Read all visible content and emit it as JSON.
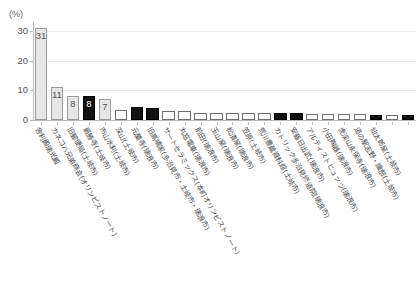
{
  "chart_data": {
    "type": "bar",
    "title": "",
    "xlabel": "",
    "ylabel": "(%)",
    "ylim": [
      0,
      33
    ],
    "yticks": [
      0,
      10,
      20,
      30
    ],
    "ytick_labels": [
      "0",
      "10",
      "20",
      "30"
    ],
    "grid": true,
    "legend": "none",
    "value_label_note": "Only the first five bars carry printed value labels; remaining bars are unlabeled and read off the axis.",
    "categories": [
      "舎利殿瑞光殿",
      "カネコハ兄弟商会(オリンピストノート)",
      "旧郵便局(土岐市)",
      "最勝寺(土岐市)",
      "市山水利(土岐市)",
      "深山(土岐市)",
      "元蘭寺(瑞浪市)",
      "旧高橋家(多治見市・土岐市・瑞浪市)",
      "サートセラミックス(本町オリンピストノート)",
      "丸窓電車(瑞浪市)",
      "前田(瑞浪市)",
      "玉山窯(瑞浪市)",
      "松漬窯(瑞浪市)",
      "笠原(土岐市)",
      "荒川豊蔵資料館(土岐市)",
      "カトリック多治見修道院(瑞浪市)",
      "安藤日出武(瑞浪市)",
      "アルティストヒュッツ(瑞浪市)",
      "小田陶器(瑞浪市)",
      "虎渓山永保寺(瑞浪市)",
      "道の駅志野・織部(土岐市)",
      "仙太郎窯(土岐市)"
    ],
    "values": [
      31,
      11,
      8,
      8,
      7,
      3.4,
      4.4,
      4.2,
      2.6,
      2.6,
      2.2,
      2.2,
      2.2,
      2.2,
      2.2,
      2.2,
      2.2,
      2.2,
      1.9,
      1.9,
      1.6,
      1.6
    ],
    "bar_styles": [
      "gray",
      "gray",
      "gray",
      "black",
      "gray",
      "white",
      "black",
      "black",
      "white",
      "white",
      "white",
      "white",
      "white",
      "white",
      "white",
      "black",
      "black",
      "white",
      "white",
      "white",
      "white",
      "black",
      "white",
      "black"
    ],
    "printed_labels": [
      "31",
      "11",
      "8",
      "8",
      "7"
    ]
  },
  "axis": {
    "unit_label": "(%)",
    "ytick_labels": [
      "30",
      "20",
      "10",
      "0"
    ]
  },
  "bars": [
    {
      "value": 31,
      "label": "31",
      "style": "gray",
      "category": "舎利殿瑞光殿"
    },
    {
      "value": 11,
      "label": "11",
      "style": "gray",
      "category": "カネコハ兄弟商会(オリンピストノート)"
    },
    {
      "value": 8,
      "label": "8",
      "style": "gray",
      "category": "旧郵便局(土岐市)"
    },
    {
      "value": 8,
      "label": "8",
      "style": "black",
      "category": "最勝寺(土岐市)"
    },
    {
      "value": 7,
      "label": "7",
      "style": "gray",
      "category": "市山水利(土岐市)"
    },
    {
      "value": 3.4,
      "label": "",
      "style": "white",
      "category": "深山(土岐市)"
    },
    {
      "value": 4.4,
      "label": "",
      "style": "black",
      "category": "元蘭寺(瑞浪市)"
    },
    {
      "value": 4.2,
      "label": "",
      "style": "black",
      "category": "旧高橋家(多治見市・土岐市・瑞浪市)"
    },
    {
      "value": 2.9,
      "label": "",
      "style": "white",
      "category": "サートセラミックス(本町オリンピストノート)"
    },
    {
      "value": 2.9,
      "label": "",
      "style": "white",
      "category": "丸窓電車(瑞浪市)"
    },
    {
      "value": 2.4,
      "label": "",
      "style": "white",
      "category": "前田(瑞浪市)"
    },
    {
      "value": 2.4,
      "label": "",
      "style": "white",
      "category": "玉山窯(瑞浪市)"
    },
    {
      "value": 2.4,
      "label": "",
      "style": "white",
      "category": "松漬窯(瑞浪市)"
    },
    {
      "value": 2.4,
      "label": "",
      "style": "white",
      "category": "笠原(土岐市)"
    },
    {
      "value": 2.4,
      "label": "",
      "style": "white",
      "category": "荒川豊蔵資料館(土岐市)"
    },
    {
      "value": 2.4,
      "label": "",
      "style": "black",
      "category": "カトリック多治見修道院(瑞浪市)"
    },
    {
      "value": 2.4,
      "label": "",
      "style": "black",
      "category": "安藤日出武(瑞浪市)"
    },
    {
      "value": 1.9,
      "label": "",
      "style": "white",
      "category": "アルティストヒュッツ(瑞浪市)"
    },
    {
      "value": 1.9,
      "label": "",
      "style": "white",
      "category": "小田陶器(瑞浪市)"
    },
    {
      "value": 1.9,
      "label": "",
      "style": "white",
      "category": "虎渓山永保寺(瑞浪市)"
    },
    {
      "value": 1.9,
      "label": "",
      "style": "white",
      "category": "道の駅志野・織部(土岐市)"
    },
    {
      "value": 1.6,
      "label": "",
      "style": "black",
      "category": "仙太郎窯(土岐市)"
    },
    {
      "value": 1.6,
      "label": "",
      "style": "white",
      "category": ""
    },
    {
      "value": 1.6,
      "label": "",
      "style": "black",
      "category": ""
    }
  ],
  "colors": {
    "bar_gray_fill": "#e6e6e6",
    "bar_gray_border": "#9a9a9a",
    "bar_black_fill": "#121212",
    "bar_white_fill": "#ffffff",
    "bar_white_border": "#6f6f6f",
    "gridline": "#e9e9e9",
    "axis": "#b9b9b9",
    "text": "#4a4a4a"
  }
}
